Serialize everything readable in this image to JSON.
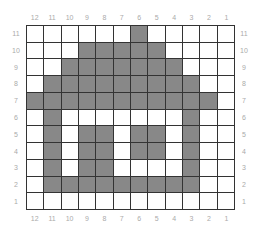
{
  "grid": {
    "columns": [
      "12",
      "11",
      "10",
      "9",
      "8",
      "7",
      "6",
      "5",
      "4",
      "3",
      "2",
      "1"
    ],
    "rows": [
      "11",
      "10",
      "9",
      "8",
      "7",
      "6",
      "5",
      "4",
      "3",
      "2",
      "1"
    ],
    "fill_color": "#888888",
    "empty_color": "#ffffff",
    "line_color": "#333333",
    "filled": {
      "11": [
        "6"
      ],
      "10": [
        "9",
        "8",
        "7",
        "6",
        "5"
      ],
      "9": [
        "10",
        "9",
        "8",
        "7",
        "6",
        "5",
        "4"
      ],
      "8": [
        "11",
        "10",
        "9",
        "8",
        "7",
        "6",
        "5",
        "4",
        "3"
      ],
      "7": [
        "12",
        "11",
        "10",
        "9",
        "8",
        "7",
        "6",
        "5",
        "4",
        "3",
        "2"
      ],
      "6": [
        "11",
        "3"
      ],
      "5": [
        "11",
        "9",
        "8",
        "6",
        "5",
        "3"
      ],
      "4": [
        "11",
        "9",
        "8",
        "6",
        "5",
        "3"
      ],
      "3": [
        "11",
        "9",
        "8",
        "3"
      ],
      "2": [
        "11",
        "10",
        "9",
        "8",
        "7",
        "6",
        "5",
        "4",
        "3"
      ],
      "1": []
    }
  }
}
